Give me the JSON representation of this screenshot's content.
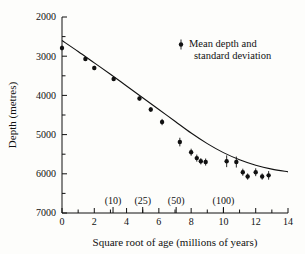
{
  "figure": {
    "title": "",
    "background_color": "#fdfdfb",
    "ink_color": "#111111"
  },
  "axes": {
    "xlabel": "Square root of age (millions of years)",
    "ylabel": "Depth (metres)",
    "x_ticks": [
      "0",
      "2",
      "4",
      "6",
      "8",
      "10",
      "12",
      "14"
    ],
    "y_ticks": [
      "2000",
      "3000",
      "4000",
      "5000",
      "6000",
      "7000"
    ],
    "x_annotations": [
      {
        "label": "(10)",
        "x": 3.162
      },
      {
        "label": "(25)",
        "x": 5.0
      },
      {
        "label": "(50)",
        "x": 7.071
      },
      {
        "label": "(100)",
        "x": 10.0
      }
    ]
  },
  "legend": {
    "marker": "errorbar-point-marker",
    "line1": "Mean depth and",
    "line2": "standard deviation"
  },
  "chart_data": {
    "type": "scatter",
    "title": "",
    "subtitle": "",
    "xlabel": "Square root of age (millions of years)",
    "ylabel": "Depth (metres)",
    "xlim": [
      0,
      14
    ],
    "ylim": [
      2000,
      7000
    ],
    "y_inverted": true,
    "grid": false,
    "x_major_tick_step": 2,
    "x_minor_tick_step": 1,
    "y_major_tick_step": 1000,
    "y_minor_tick_step": 500,
    "legend_position": "top-right",
    "legend_entries": [
      "Mean depth and standard deviation"
    ],
    "annotations": [
      {
        "text": "(10)",
        "x": 3.162,
        "y": 6780
      },
      {
        "text": "(25)",
        "x": 5.0,
        "y": 6780
      },
      {
        "text": "(50)",
        "x": 7.071,
        "y": 6780
      },
      {
        "text": "(100)",
        "x": 10.0,
        "y": 6780
      }
    ],
    "series": [
      {
        "name": "Mean depth and standard deviation",
        "type": "scatter",
        "marker": "filled-circle",
        "error": "standard deviation (vertical bars)",
        "x": [
          0.0,
          1.45,
          2.0,
          3.2,
          4.8,
          5.5,
          6.2,
          7.3,
          8.0,
          8.35,
          8.6,
          8.9,
          10.2,
          10.8,
          11.2,
          11.5,
          12.0,
          12.4,
          12.8
        ],
        "y": [
          2790,
          3070,
          3300,
          3580,
          4080,
          4360,
          4680,
          5190,
          5450,
          5600,
          5680,
          5700,
          5680,
          5700,
          5960,
          6070,
          5960,
          6070,
          6040
        ],
        "yerr": [
          60,
          50,
          55,
          50,
          50,
          60,
          80,
          110,
          90,
          90,
          80,
          90,
          150,
          140,
          90,
          80,
          100,
          80,
          110
        ]
      },
      {
        "name": "fitted curve",
        "type": "line",
        "x": [
          0.0,
          1.0,
          2.0,
          3.0,
          4.0,
          5.0,
          6.0,
          7.0,
          8.0,
          9.0,
          10.0,
          11.0,
          12.0,
          13.0,
          14.0
        ],
        "y": [
          2600,
          2880,
          3170,
          3460,
          3760,
          4060,
          4360,
          4660,
          4960,
          5230,
          5460,
          5640,
          5780,
          5880,
          5950
        ]
      }
    ]
  }
}
